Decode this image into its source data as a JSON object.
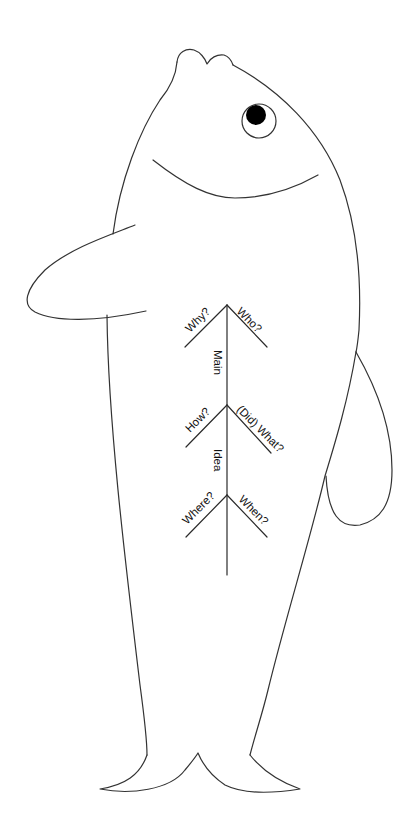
{
  "diagram": {
    "type": "fishbone",
    "title": "",
    "colors": {
      "outline": "#333333",
      "pupil": "#000000",
      "background": "#ffffff"
    },
    "spine_labels": [
      "Main",
      "Idea"
    ],
    "branches": [
      {
        "position": "top-left",
        "label": "Why?"
      },
      {
        "position": "top-right",
        "label": "Who?"
      },
      {
        "position": "middle-left",
        "label": "How?"
      },
      {
        "position": "middle-right",
        "label": "(Did) What?"
      },
      {
        "position": "bottom-left",
        "label": "Where?"
      },
      {
        "position": "bottom-right",
        "label": "When?"
      }
    ]
  }
}
